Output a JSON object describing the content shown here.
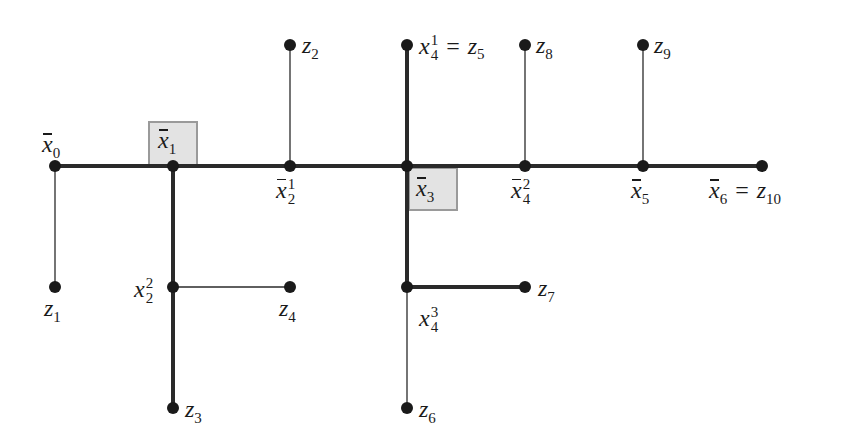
{
  "diagram": {
    "type": "tree",
    "colors": {
      "line": "#2a2a2a",
      "node": "#1a1a1a",
      "highlight_fill": "#e3e3e3",
      "highlight_border": "#9a9a9a"
    },
    "nodes": [
      {
        "id": "x0",
        "x": 55,
        "y": 166
      },
      {
        "id": "x1",
        "x": 173,
        "y": 166
      },
      {
        "id": "x2_1",
        "x": 290,
        "y": 166
      },
      {
        "id": "x3",
        "x": 407,
        "y": 166
      },
      {
        "id": "x4_2",
        "x": 525,
        "y": 166
      },
      {
        "id": "x5",
        "x": 643,
        "y": 166
      },
      {
        "id": "x6",
        "x": 762,
        "y": 166
      },
      {
        "id": "z2",
        "x": 290,
        "y": 45
      },
      {
        "id": "x4_1",
        "x": 407,
        "y": 45
      },
      {
        "id": "z8",
        "x": 525,
        "y": 45
      },
      {
        "id": "z9",
        "x": 643,
        "y": 45
      },
      {
        "id": "z1",
        "x": 55,
        "y": 287
      },
      {
        "id": "x2_2",
        "x": 173,
        "y": 287
      },
      {
        "id": "z4",
        "x": 290,
        "y": 287
      },
      {
        "id": "x4_3",
        "x": 407,
        "y": 287
      },
      {
        "id": "z7",
        "x": 525,
        "y": 287
      },
      {
        "id": "z3",
        "x": 173,
        "y": 408
      },
      {
        "id": "z6",
        "x": 407,
        "y": 408
      }
    ],
    "edges": [
      {
        "from": "x0",
        "to": "x6",
        "weight": "thick"
      },
      {
        "from": "x1",
        "to": "z3",
        "weight": "thick"
      },
      {
        "from": "x4_1",
        "to": "x4_3",
        "weight": "thick"
      },
      {
        "from": "x4_3",
        "to": "z7",
        "weight": "thick"
      },
      {
        "from": "x0",
        "to": "z1",
        "weight": "thin"
      },
      {
        "from": "x2_2",
        "to": "z4",
        "weight": "thin"
      },
      {
        "from": "x2_1",
        "to": "z2",
        "weight": "thin"
      },
      {
        "from": "x4_2",
        "to": "z8",
        "weight": "thin"
      },
      {
        "from": "x5",
        "to": "z9",
        "weight": "thin"
      },
      {
        "from": "x4_3",
        "to": "z6",
        "weight": "thin"
      }
    ],
    "highlighted": [
      "x1",
      "x3"
    ]
  },
  "labels": {
    "x0": {
      "base": "x",
      "bar": true,
      "sub": "0"
    },
    "x1": {
      "base": "x",
      "bar": true,
      "sub": "1"
    },
    "x2_1": {
      "base": "x",
      "bar": true,
      "sub": "2",
      "sup": "1"
    },
    "x3": {
      "base": "x",
      "bar": true,
      "sub": "3"
    },
    "x4_2": {
      "base": "x",
      "bar": true,
      "sub": "4",
      "sup": "2"
    },
    "x5": {
      "base": "x",
      "bar": true,
      "sub": "5"
    },
    "x6": {
      "base": "x",
      "bar": true,
      "sub": "6",
      "eq": "=",
      "rhs_base": "z",
      "rhs_sub": "10"
    },
    "x4_1": {
      "base": "x",
      "sub": "4",
      "sup": "1",
      "eq": "=",
      "rhs_base": "z",
      "rhs_sub": "5"
    },
    "x2_2": {
      "base": "x",
      "sub": "2",
      "sup": "2"
    },
    "x4_3": {
      "base": "x",
      "sub": "4",
      "sup": "3"
    },
    "z1": {
      "base": "z",
      "sub": "1"
    },
    "z2": {
      "base": "z",
      "sub": "2"
    },
    "z3": {
      "base": "z",
      "sub": "3"
    },
    "z4": {
      "base": "z",
      "sub": "4"
    },
    "z6": {
      "base": "z",
      "sub": "6"
    },
    "z7": {
      "base": "z",
      "sub": "7"
    },
    "z8": {
      "base": "z",
      "sub": "8"
    },
    "z9": {
      "base": "z",
      "sub": "9"
    }
  }
}
